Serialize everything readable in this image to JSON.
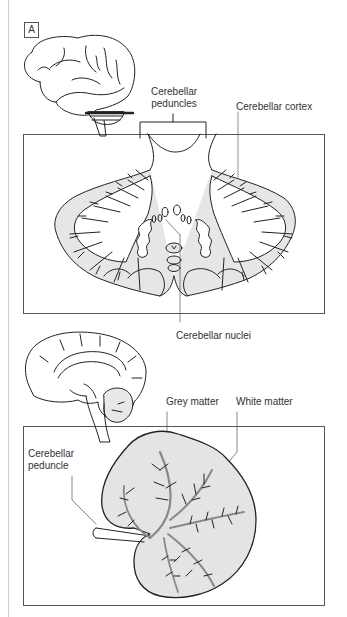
{
  "figure": {
    "panel_label": "A",
    "top_section": {
      "labels": {
        "peduncles_line1": "Cerebellar",
        "peduncles_line2": "peduncles",
        "cortex": "Cerebellar cortex",
        "nuclei": "Cerebellar nuclei"
      }
    },
    "bottom_section": {
      "labels": {
        "grey_matter": "Grey matter",
        "white_matter": "White matter",
        "peduncle_line1": "Cerebellar",
        "peduncle_line2": "peduncle"
      }
    },
    "colors": {
      "line": "#222222",
      "frame": "#555555",
      "grey_matter_fill": "#e4e4e4",
      "white_matter_fill": "#ffffff",
      "background": "#ffffff"
    }
  }
}
